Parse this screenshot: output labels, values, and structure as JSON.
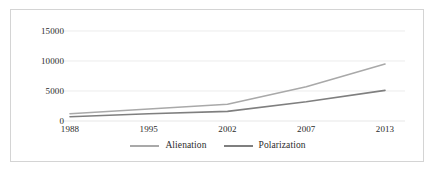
{
  "chart_data": {
    "type": "line",
    "title": "",
    "subtitle": "",
    "xlabel": "",
    "ylabel": "",
    "categories": [
      "1988",
      "1995",
      "2002",
      "2007",
      "2013"
    ],
    "x": [
      1988,
      1995,
      2002,
      2007,
      2013
    ],
    "series": [
      {
        "name": "Alienation",
        "color": "#a9a9a9",
        "values": [
          1200,
          2000,
          2800,
          5700,
          9500
        ]
      },
      {
        "name": "Polarization",
        "color": "#7f7f7f",
        "values": [
          700,
          1200,
          1600,
          3200,
          5100
        ]
      }
    ],
    "ylim": [
      0,
      15000
    ],
    "yticks": [
      0,
      5000,
      10000,
      15000
    ],
    "ytick_labels": [
      "0",
      "5000",
      "10000",
      "15000"
    ],
    "xtick_labels": [
      "1988",
      "1995",
      "2002",
      "2007",
      "2013"
    ],
    "grid": {
      "horizontal": true,
      "vertical": false,
      "color": "#e4e4e4"
    },
    "legend": {
      "position": "bottom",
      "entries": [
        {
          "label": "Alienation",
          "color": "#a9a9a9"
        },
        {
          "label": "Polarization",
          "color": "#7f7f7f"
        }
      ]
    },
    "border_color": "#d4d4d4",
    "background_color": "#ffffff"
  },
  "axes": {
    "y_ticks": [
      {
        "label": "15000",
        "value": 15000
      },
      {
        "label": "10000",
        "value": 10000
      },
      {
        "label": "5000",
        "value": 5000
      },
      {
        "label": "0",
        "value": 0
      }
    ],
    "x_ticks": [
      {
        "label": "1988",
        "value": 1988
      },
      {
        "label": "1995",
        "value": 1995
      },
      {
        "label": "2002",
        "value": 2002
      },
      {
        "label": "2007",
        "value": 2007
      },
      {
        "label": "2013",
        "value": 2013
      }
    ]
  }
}
